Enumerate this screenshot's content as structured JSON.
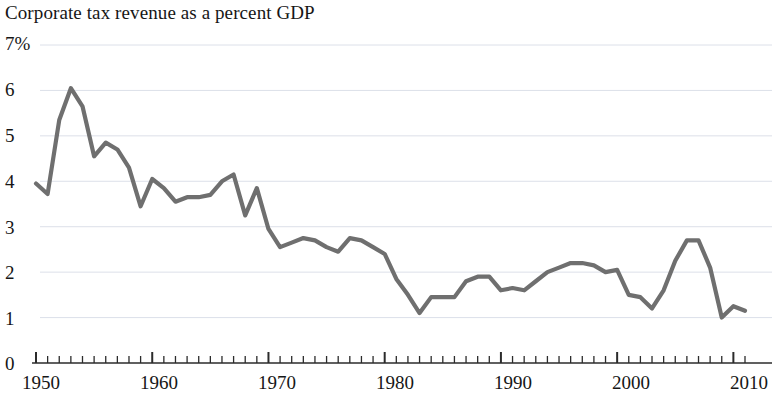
{
  "chart_data": {
    "type": "line",
    "title": "Corporate tax revenue as a percent GDP",
    "xlabel": "",
    "ylabel": "",
    "ylim": [
      0,
      7
    ],
    "xlim": [
      1950,
      2011
    ],
    "grid": true,
    "legend": false,
    "line_color": "#6f6f6f",
    "y_ticks": [
      "7%",
      "6",
      "5",
      "4",
      "3",
      "2",
      "1",
      "0"
    ],
    "y_tick_values": [
      7,
      6,
      5,
      4,
      3,
      2,
      1,
      0
    ],
    "x_ticks": [
      "1950",
      "1960",
      "1970",
      "1980",
      "1990",
      "2000",
      "2010"
    ],
    "x_tick_values": [
      1950,
      1960,
      1970,
      1980,
      1990,
      2000,
      2010
    ],
    "x_minor_tick_interval": 1,
    "x": [
      1950,
      1951,
      1952,
      1953,
      1954,
      1955,
      1956,
      1957,
      1958,
      1959,
      1960,
      1961,
      1962,
      1963,
      1964,
      1965,
      1966,
      1967,
      1968,
      1969,
      1970,
      1971,
      1972,
      1973,
      1974,
      1975,
      1976,
      1977,
      1978,
      1979,
      1980,
      1981,
      1982,
      1983,
      1984,
      1985,
      1986,
      1987,
      1988,
      1989,
      1990,
      1991,
      1992,
      1993,
      1994,
      1995,
      1996,
      1997,
      1998,
      1999,
      2000,
      2001,
      2002,
      2003,
      2004,
      2005,
      2006,
      2007,
      2008,
      2009,
      2010,
      2011
    ],
    "values": [
      3.95,
      3.72,
      5.35,
      6.05,
      5.65,
      4.55,
      4.85,
      4.7,
      4.3,
      3.45,
      4.05,
      3.85,
      3.55,
      3.65,
      3.65,
      3.7,
      4.0,
      4.15,
      3.25,
      3.85,
      2.95,
      2.55,
      2.65,
      2.75,
      2.7,
      2.55,
      2.45,
      2.75,
      2.7,
      2.55,
      2.4,
      1.85,
      1.5,
      1.1,
      1.45,
      1.45,
      1.45,
      1.8,
      1.9,
      1.9,
      1.6,
      1.65,
      1.6,
      1.8,
      2.0,
      2.1,
      2.2,
      2.2,
      2.15,
      2.0,
      2.05,
      1.5,
      1.45,
      1.2,
      1.6,
      2.25,
      2.7,
      2.7,
      2.1,
      1.0,
      1.25,
      1.15
    ]
  }
}
